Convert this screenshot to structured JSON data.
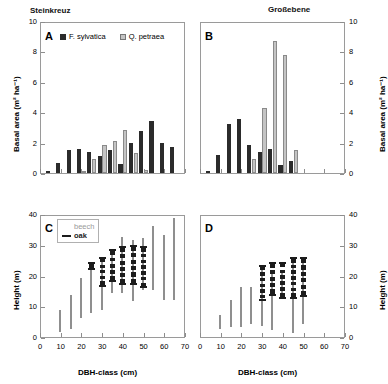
{
  "figure": {
    "site_left": "Steinkreuz",
    "site_right": "Großebene"
  },
  "axes": {
    "basal_area_label": "Basal area (m² ha⁻¹)",
    "height_label": "Height (m)",
    "dbh_label": "DBH-class (cm)",
    "basal_ticks": [
      "0",
      "2",
      "4",
      "6",
      "8",
      "10"
    ],
    "height_ticks": [
      "0",
      "10",
      "20",
      "30",
      "40"
    ],
    "dbh_ticks": [
      "0",
      "10",
      "20",
      "30",
      "40",
      "50",
      "60",
      "70"
    ]
  },
  "legends": {
    "panelA": {
      "beech_label": "F. sylvatica",
      "oak_label": "Q. petraea",
      "beech_color": "#2b2b2b",
      "oak_color": "#c4c4c4"
    },
    "panelC": {
      "beech_label": "beech",
      "oak_label": "oak",
      "beech_color": "#9a9a9a",
      "oak_color": "#1c1c1c"
    }
  },
  "panels": {
    "A": {
      "label": "A",
      "site": "Steinkreuz",
      "measure": "basal_area"
    },
    "B": {
      "label": "B",
      "site": "Großebene",
      "measure": "basal_area"
    },
    "C": {
      "label": "C",
      "site": "Steinkreuz",
      "measure": "height"
    },
    "D": {
      "label": "D",
      "site": "Großebene",
      "measure": "height"
    }
  },
  "chart_data": [
    {
      "type": "bar",
      "panel": "A",
      "title": "Steinkreuz",
      "xlabel": "DBH-class (cm)",
      "ylabel": "Basal area (m² ha⁻¹)",
      "ylim": [
        0,
        10
      ],
      "xlim": [
        0,
        70
      ],
      "grid": false,
      "legend_position": "top-left",
      "categories": [
        5,
        10,
        15,
        20,
        25,
        30,
        35,
        40,
        45,
        50,
        55,
        60,
        65
      ],
      "series": [
        {
          "name": "F. sylvatica",
          "color": "#2b2b2b",
          "values": [
            0.1,
            0.65,
            1.5,
            1.55,
            1.4,
            1.1,
            1.5,
            0.6,
            1.95,
            2.75,
            3.45,
            1.95,
            1.7
          ]
        },
        {
          "name": "Q. petraea",
          "color": "#c4c4c4",
          "values": [
            0.0,
            0.0,
            0.0,
            0.15,
            0.9,
            1.85,
            2.1,
            2.85,
            1.3,
            0.2,
            0.0,
            0.0,
            0.0
          ]
        }
      ]
    },
    {
      "type": "bar",
      "panel": "B",
      "title": "Großebene",
      "xlabel": "DBH-class (cm)",
      "ylabel": "Basal area (m² ha⁻¹)",
      "ylim": [
        0,
        10
      ],
      "xlim": [
        0,
        70
      ],
      "grid": false,
      "legend_position": "none",
      "categories": [
        5,
        10,
        15,
        20,
        25,
        30,
        35,
        40,
        45,
        50,
        55,
        60,
        65
      ],
      "series": [
        {
          "name": "F. sylvatica",
          "color": "#2b2b2b",
          "values": [
            0.15,
            1.2,
            3.25,
            3.55,
            1.85,
            1.4,
            1.6,
            0.55,
            0.8,
            0.0,
            0.0,
            0.0,
            0.0
          ]
        },
        {
          "name": "Q. petraea",
          "color": "#c4c4c4",
          "values": [
            0.0,
            0.0,
            0.0,
            0.0,
            0.95,
            4.3,
            8.7,
            7.75,
            1.5,
            0.0,
            0.0,
            0.0,
            0.0
          ]
        }
      ]
    },
    {
      "type": "range",
      "panel": "C",
      "title": "Steinkreuz",
      "xlabel": "DBH-class (cm)",
      "ylabel": "Height (m)",
      "ylim": [
        0,
        40
      ],
      "xlim": [
        0,
        70
      ],
      "grid": false,
      "legend_position": "top-left",
      "series": [
        {
          "name": "beech",
          "color": "#8f8f8f",
          "points": [
            {
              "x": 10,
              "low": 2.0,
              "high": 9.0
            },
            {
              "x": 15,
              "low": 3.0,
              "high": 14.0
            },
            {
              "x": 20,
              "low": 6.5,
              "high": 19.5
            },
            {
              "x": 25,
              "low": 8.0,
              "high": 24.5
            },
            {
              "x": 30,
              "low": 9.0,
              "high": 26.0
            },
            {
              "x": 35,
              "low": 14.5,
              "high": 28.5
            },
            {
              "x": 40,
              "low": 14.5,
              "high": 33.0
            },
            {
              "x": 45,
              "low": 12.0,
              "high": 32.0
            },
            {
              "x": 50,
              "low": 15.5,
              "high": 32.5
            },
            {
              "x": 55,
              "low": 15.5,
              "high": 36.5
            },
            {
              "x": 60,
              "low": 12.5,
              "high": 33.5
            },
            {
              "x": 65,
              "low": 12.5,
              "high": 39.0
            }
          ]
        },
        {
          "name": "oak",
          "color": "#1c1c1c",
          "points": [
            {
              "x": 25,
              "low": 22.5,
              "high": 24.5
            },
            {
              "x": 30,
              "low": 17.0,
              "high": 26.0
            },
            {
              "x": 35,
              "low": 18.5,
              "high": 28.5
            },
            {
              "x": 40,
              "low": 17.5,
              "high": 29.5
            },
            {
              "x": 45,
              "low": 17.5,
              "high": 30.0
            },
            {
              "x": 50,
              "low": 16.5,
              "high": 29.5
            }
          ]
        }
      ]
    },
    {
      "type": "range",
      "panel": "D",
      "title": "Großebene",
      "xlabel": "DBH-class (cm)",
      "ylabel": "Height (m)",
      "ylim": [
        0,
        40
      ],
      "xlim": [
        0,
        70
      ],
      "grid": false,
      "legend_position": "none",
      "series": [
        {
          "name": "beech",
          "color": "#8f8f8f",
          "points": [
            {
              "x": 10,
              "low": 3.0,
              "high": 7.5
            },
            {
              "x": 15,
              "low": 3.5,
              "high": 12.5
            },
            {
              "x": 20,
              "low": 3.5,
              "high": 16.5
            },
            {
              "x": 25,
              "low": 4.5,
              "high": 16.5
            },
            {
              "x": 30,
              "low": 4.0,
              "high": 23.5
            },
            {
              "x": 35,
              "low": 2.5,
              "high": 21.0
            },
            {
              "x": 40,
              "low": 13.0,
              "high": 22.0
            },
            {
              "x": 45,
              "low": 1.5,
              "high": 25.5
            },
            {
              "x": 50,
              "low": 4.5,
              "high": 25.5
            }
          ]
        },
        {
          "name": "oak",
          "color": "#1c1c1c",
          "points": [
            {
              "x": 30,
              "low": 12.5,
              "high": 23.5
            },
            {
              "x": 35,
              "low": 14.0,
              "high": 24.5
            },
            {
              "x": 40,
              "low": 13.0,
              "high": 24.5
            },
            {
              "x": 45,
              "low": 13.0,
              "high": 26.0
            },
            {
              "x": 50,
              "low": 13.5,
              "high": 26.0
            }
          ]
        }
      ]
    }
  ]
}
